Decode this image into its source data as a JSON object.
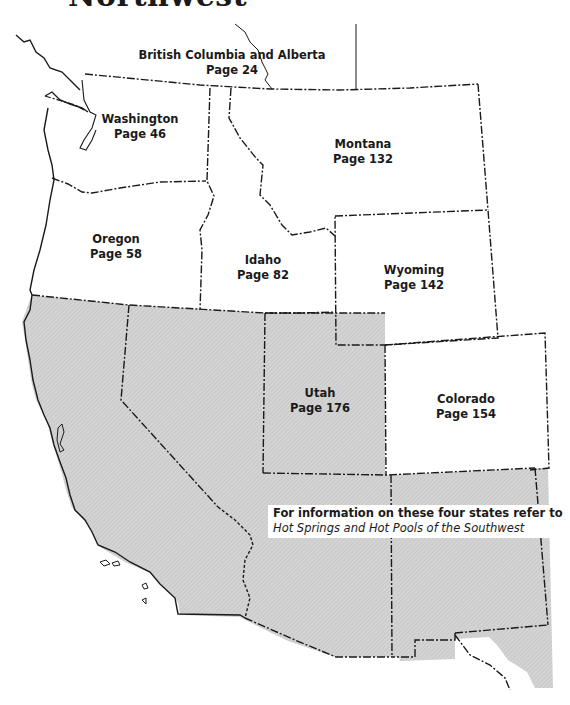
{
  "title": "Northwest",
  "regions": [
    {
      "name": "British Columbia and Alberta",
      "page": "Page 24"
    },
    {
      "name": "Washington",
      "page": "Page 46"
    },
    {
      "name": "Montana",
      "page": "Page 132"
    },
    {
      "name": "Oregon",
      "page": "Page 58"
    },
    {
      "name": "Idaho",
      "page": "Page 82"
    },
    {
      "name": "Wyoming",
      "page": "Page 142"
    },
    {
      "name": "Utah",
      "page": "Page 176"
    },
    {
      "name": "Colorado",
      "page": "Page 154"
    }
  ],
  "note": {
    "line1": "For information on these four states refer to",
    "line2": "Hot Springs and Hot Pools of the Southwest"
  },
  "colors": {
    "shaded": "#d6d6d6",
    "border": "#1a1a1a",
    "background": "#ffffff"
  }
}
